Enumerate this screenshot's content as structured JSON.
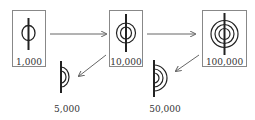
{
  "diagram": {
    "colors": {
      "stroke": "#222222",
      "box": "#888888",
      "arrow": "#666666"
    },
    "boxes": [
      {
        "id": "box-1000",
        "label": "1,000",
        "rings": 1
      },
      {
        "id": "box-10000",
        "label": "10,000",
        "rings": 2
      },
      {
        "id": "box-100000",
        "label": "100,000",
        "rings": 3
      }
    ],
    "halves": [
      {
        "id": "half-5000",
        "label": "5,000",
        "rings": 1
      },
      {
        "id": "half-50000",
        "label": "50,000",
        "rings": 2
      }
    ],
    "arrows": [
      {
        "from": "1,000",
        "to": "10,000"
      },
      {
        "from": "10,000",
        "to": "100,000"
      },
      {
        "from": "10,000",
        "to": "5,000"
      },
      {
        "from": "100,000",
        "to": "50,000"
      }
    ]
  }
}
